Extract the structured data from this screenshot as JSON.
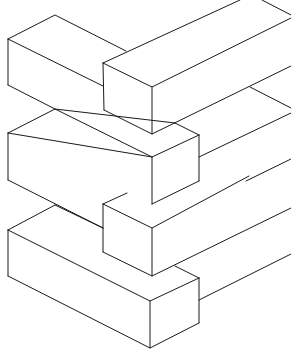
{
  "figure": {
    "title": "",
    "stroke_color": "#1a1a1a",
    "background": "#ffffff",
    "blocks": [
      {
        "name": "upper-left-block"
      },
      {
        "name": "upper-right-beam"
      },
      {
        "name": "middle-left-block"
      },
      {
        "name": "middle-right-beam"
      },
      {
        "name": "lower-right-block"
      },
      {
        "name": "lower-left-block"
      }
    ]
  }
}
